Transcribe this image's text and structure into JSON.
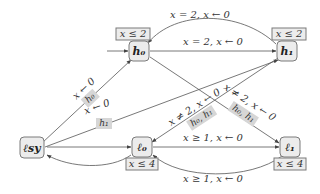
{
  "diagram": {
    "type": "timed-automaton",
    "nodes": {
      "h0": {
        "label": "h₀",
        "invariant": "x ≤ 2"
      },
      "h1": {
        "label": "h₁",
        "invariant": "x ≤ 2"
      },
      "lsy": {
        "label": "ℓsy"
      },
      "l0": {
        "label": "ℓ₀",
        "invariant": "x ≤ 4"
      },
      "l1": {
        "label": "ℓ₁",
        "invariant": "x ≤ 4"
      }
    },
    "edges": {
      "h1_h0_top": {
        "label": "x = 2, x ← 0"
      },
      "h0_h1": {
        "label": "x = 2, x ← 0"
      },
      "lsy_h0": {
        "label": "x ← 0",
        "highlight": "h₀"
      },
      "lsy_h1": {
        "label": "x ← 0",
        "highlight": "h₁"
      },
      "h1_l0": {
        "label": "x ≠ 2, x ← 0",
        "highlight": "h₀, h₁"
      },
      "h0_l1": {
        "label": "x ≠ 2, x ← 0",
        "highlight": "h₀, h₁"
      },
      "l0_l1": {
        "label": "x ≥ 1, x ← 0"
      },
      "l1_l0_bottom": {
        "label": "x ≥ 1, x ← 0"
      },
      "lsy_l0": {
        "label": ""
      },
      "l0_lsy": {
        "label": ""
      }
    }
  }
}
